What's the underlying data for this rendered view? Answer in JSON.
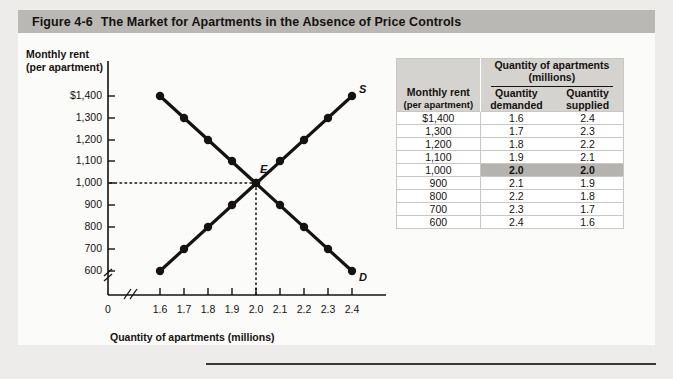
{
  "figure": {
    "number": "Figure  4-6",
    "title": "The Market for Apartments in the Absence of Price Controls"
  },
  "chart_data": {
    "type": "line",
    "title": "The Market for Apartments in the Absence of Price Controls",
    "xlabel": "Quantity of apartments (millions)",
    "ylabel_line1": "Monthly rent",
    "ylabel_line2": "(per apartment)",
    "x": [
      1.6,
      1.7,
      1.8,
      1.9,
      2.0,
      2.1,
      2.2,
      2.3,
      2.4
    ],
    "xtick_labels": [
      "1.6",
      "1.7",
      "1.8",
      "1.9",
      "2.0",
      "2.1",
      "2.2",
      "2.3",
      "2.4"
    ],
    "origin_label": "0",
    "ytick_values": [
      1400,
      1300,
      1200,
      1100,
      1000,
      900,
      800,
      700,
      600
    ],
    "ytick_labels": [
      "$1,400",
      "1,300",
      "1,200",
      "1,100",
      "1,000",
      "900",
      "800",
      "700",
      "600"
    ],
    "xlim": [
      1.6,
      2.4
    ],
    "ylim": [
      600,
      1400
    ],
    "grid": false,
    "axis_break_x": true,
    "axis_break_y": true,
    "series": [
      {
        "name": "D",
        "label": "D",
        "description": "demand curve",
        "points": [
          {
            "x": 1.6,
            "y": 1400
          },
          {
            "x": 1.7,
            "y": 1300
          },
          {
            "x": 1.8,
            "y": 1200
          },
          {
            "x": 1.9,
            "y": 1100
          },
          {
            "x": 2.0,
            "y": 1000
          },
          {
            "x": 2.1,
            "y": 900
          },
          {
            "x": 2.2,
            "y": 800
          },
          {
            "x": 2.3,
            "y": 700
          },
          {
            "x": 2.4,
            "y": 600
          }
        ]
      },
      {
        "name": "S",
        "label": "S",
        "description": "supply curve",
        "points": [
          {
            "x": 1.6,
            "y": 600
          },
          {
            "x": 1.7,
            "y": 700
          },
          {
            "x": 1.8,
            "y": 800
          },
          {
            "x": 1.9,
            "y": 900
          },
          {
            "x": 2.0,
            "y": 1000
          },
          {
            "x": 2.1,
            "y": 1100
          },
          {
            "x": 2.2,
            "y": 1200
          },
          {
            "x": 2.3,
            "y": 1300
          },
          {
            "x": 2.4,
            "y": 1400
          }
        ]
      }
    ],
    "annotations": [
      {
        "label": "E",
        "x": 2.0,
        "y": 1000,
        "description": "equilibrium point"
      }
    ],
    "guide_lines": {
      "horizontal_at_y": 1000,
      "vertical_at_x": 2.0,
      "style": "dotted"
    }
  },
  "table": {
    "rent_header_line1": "Monthly rent",
    "rent_header_line2": "(per apartment)",
    "group_header_line1": "Quantity of apartments",
    "group_header_line2": "(millions)",
    "demanded_header_line1": "Quantity",
    "demanded_header_line2": "demanded",
    "supplied_header_line1": "Quantity",
    "supplied_header_line2": "supplied",
    "rows": [
      {
        "rent": "$1,400",
        "demanded": "1.6",
        "supplied": "2.4",
        "equilibrium": false
      },
      {
        "rent": "1,300",
        "demanded": "1.7",
        "supplied": "2.3",
        "equilibrium": false
      },
      {
        "rent": "1,200",
        "demanded": "1.8",
        "supplied": "2.2",
        "equilibrium": false
      },
      {
        "rent": "1,100",
        "demanded": "1.9",
        "supplied": "2.1",
        "equilibrium": false
      },
      {
        "rent": "1,000",
        "demanded": "2.0",
        "supplied": "2.0",
        "equilibrium": true
      },
      {
        "rent": "900",
        "demanded": "2.1",
        "supplied": "1.9",
        "equilibrium": false
      },
      {
        "rent": "800",
        "demanded": "2.2",
        "supplied": "1.8",
        "equilibrium": false
      },
      {
        "rent": "700",
        "demanded": "2.3",
        "supplied": "1.7",
        "equilibrium": false
      },
      {
        "rent": "600",
        "demanded": "2.4",
        "supplied": "1.6",
        "equilibrium": false
      }
    ]
  },
  "colors": {
    "header_bar": "#b9b8b4",
    "panel": "#fbfbfa",
    "page": "#e9e8e6",
    "ink": "#15120f",
    "table_header": "#d4d3cf",
    "highlight": "#b4b3af"
  }
}
